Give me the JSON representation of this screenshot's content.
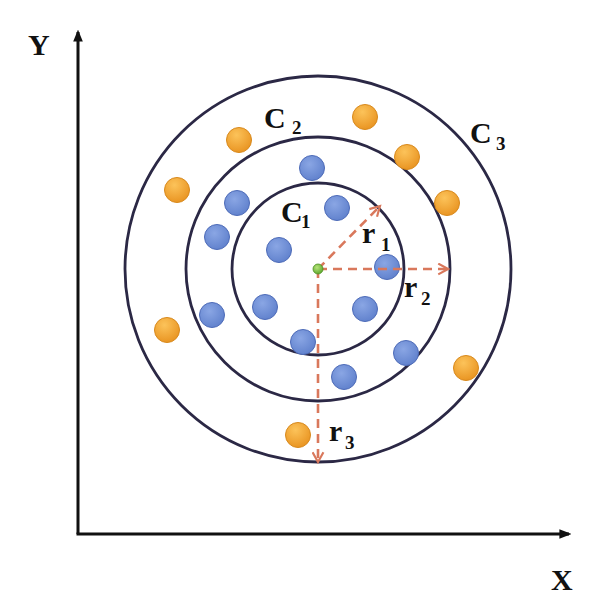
{
  "diagram": {
    "axes": {
      "x_label": "X",
      "y_label": "Y",
      "origin": [
        78,
        534
      ],
      "x_end": [
        573,
        534
      ],
      "y_end": [
        78,
        28
      ],
      "color": "#111111"
    },
    "center": {
      "x": 318,
      "y": 269,
      "r": 5,
      "color": "#7cc242"
    },
    "circles": [
      {
        "id": "C1",
        "label": "C",
        "sub": "1",
        "r": 86,
        "label_x": 281,
        "label_y": 222,
        "sub_x": 301,
        "sub_y": 228
      },
      {
        "id": "C2",
        "label": "C",
        "sub": "2",
        "r": 132,
        "label_x": 264,
        "label_y": 128,
        "sub_x": 292,
        "sub_y": 134
      },
      {
        "id": "C3",
        "label": "C",
        "sub": "3",
        "r": 193,
        "label_x": 470,
        "label_y": 143,
        "sub_x": 496,
        "sub_y": 150
      }
    ],
    "circle_color": "#2b2845",
    "radii": [
      {
        "label": "r",
        "sub": "1",
        "to_x": 380,
        "to_y": 206,
        "label_x": 362,
        "label_y": 243,
        "sub_x": 381,
        "sub_y": 251
      },
      {
        "label": "r",
        "sub": "2",
        "to_x": 448,
        "to_y": 269,
        "label_x": 404,
        "label_y": 297,
        "sub_x": 421,
        "sub_y": 305
      },
      {
        "label": "r",
        "sub": "3",
        "to_x": 318,
        "to_y": 462,
        "label_x": 329,
        "label_y": 441,
        "sub_x": 345,
        "sub_y": 449
      }
    ],
    "arrow_color": "#d9785c",
    "blue_points": {
      "color": "#6f8fd8",
      "stroke": "#4d6bb8",
      "r": 12.5,
      "points": [
        [
          312,
          168
        ],
        [
          237,
          203
        ],
        [
          337,
          208
        ],
        [
          217,
          237
        ],
        [
          279,
          250
        ],
        [
          387,
          267
        ],
        [
          212,
          315
        ],
        [
          265,
          307
        ],
        [
          365,
          309
        ],
        [
          303,
          342
        ],
        [
          406,
          353
        ],
        [
          344,
          377
        ]
      ]
    },
    "orange_points": {
      "color": "#f5a936",
      "stroke": "#d8891c",
      "r": 12.5,
      "points": [
        [
          239,
          140
        ],
        [
          365,
          117
        ],
        [
          407,
          157
        ],
        [
          177,
          190
        ],
        [
          447,
          203
        ],
        [
          167,
          330
        ],
        [
          466,
          368
        ],
        [
          298,
          435
        ]
      ]
    }
  }
}
